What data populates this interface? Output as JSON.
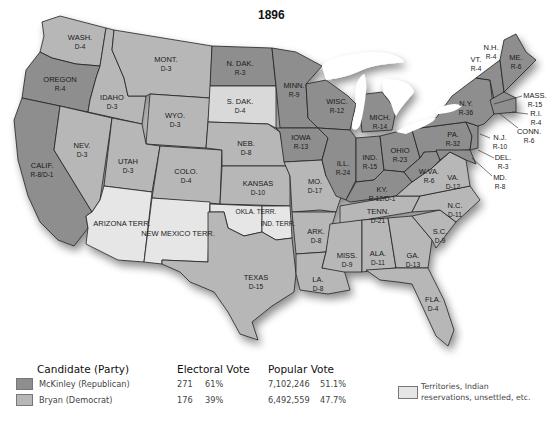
{
  "map": {
    "title": "1896",
    "colors": {
      "republican": "#8e8e8e",
      "democrat": "#b7b7b7",
      "territory": "#e6e6e6",
      "water": "#ffffff",
      "border": "#222222"
    },
    "states": [
      {
        "name": "WASH.",
        "result": "D-4",
        "party": "democrat"
      },
      {
        "name": "OREGON",
        "result": "R-4",
        "party": "republican"
      },
      {
        "name": "CALIF.",
        "result": "R-8/D-1",
        "party": "split"
      },
      {
        "name": "IDAHO",
        "result": "D-3",
        "party": "democrat"
      },
      {
        "name": "NEV.",
        "result": "D-3",
        "party": "democrat"
      },
      {
        "name": "MONT.",
        "result": "D-3",
        "party": "democrat"
      },
      {
        "name": "WYO.",
        "result": "D-3",
        "party": "democrat"
      },
      {
        "name": "UTAH",
        "result": "D-3",
        "party": "democrat"
      },
      {
        "name": "COLO.",
        "result": "D-4",
        "party": "democrat"
      },
      {
        "name": "ARIZONA TERR.",
        "result": "",
        "party": "territory"
      },
      {
        "name": "NEW MEXICO TERR.",
        "result": "",
        "party": "territory"
      },
      {
        "name": "N. DAK.",
        "result": "R-3",
        "party": "republican"
      },
      {
        "name": "S. DAK.",
        "result": "D-4",
        "party": "democrat"
      },
      {
        "name": "NEB.",
        "result": "D-8",
        "party": "democrat"
      },
      {
        "name": "KANSAS",
        "result": "D-10",
        "party": "democrat"
      },
      {
        "name": "OKLA. TERR.",
        "result": "",
        "party": "territory"
      },
      {
        "name": "IND. TERR.",
        "result": "",
        "party": "territory"
      },
      {
        "name": "TEXAS",
        "result": "D-15",
        "party": "democrat"
      },
      {
        "name": "MINN.",
        "result": "R-9",
        "party": "republican"
      },
      {
        "name": "IOWA",
        "result": "R-13",
        "party": "republican"
      },
      {
        "name": "MO.",
        "result": "D-17",
        "party": "democrat"
      },
      {
        "name": "ARK.",
        "result": "D-8",
        "party": "democrat"
      },
      {
        "name": "LA.",
        "result": "D-8",
        "party": "democrat"
      },
      {
        "name": "WISC.",
        "result": "R-12",
        "party": "republican"
      },
      {
        "name": "ILL.",
        "result": "R-24",
        "party": "republican"
      },
      {
        "name": "MICH.",
        "result": "R-14",
        "party": "republican"
      },
      {
        "name": "IND.",
        "result": "R-15",
        "party": "republican"
      },
      {
        "name": "OHIO",
        "result": "R-23",
        "party": "republican"
      },
      {
        "name": "KY.",
        "result": "R-12/D-1",
        "party": "split"
      },
      {
        "name": "TENN.",
        "result": "D-21",
        "party": "democrat"
      },
      {
        "name": "MISS.",
        "result": "D-9",
        "party": "democrat"
      },
      {
        "name": "ALA.",
        "result": "D-11",
        "party": "democrat"
      },
      {
        "name": "GA.",
        "result": "D-13",
        "party": "democrat"
      },
      {
        "name": "FLA.",
        "result": "D-4",
        "party": "democrat"
      },
      {
        "name": "S.C.",
        "result": "D-9",
        "party": "democrat"
      },
      {
        "name": "N.C.",
        "result": "D-11",
        "party": "democrat"
      },
      {
        "name": "VA.",
        "result": "D-12",
        "party": "democrat"
      },
      {
        "name": "W.VA.",
        "result": "R-6",
        "party": "republican"
      },
      {
        "name": "PA.",
        "result": "R-32",
        "party": "republican"
      },
      {
        "name": "N.Y.",
        "result": "R-36",
        "party": "republican"
      },
      {
        "name": "VT.",
        "result": "R-4",
        "party": "republican"
      },
      {
        "name": "N.H.",
        "result": "R-4",
        "party": "republican"
      },
      {
        "name": "ME.",
        "result": "R-6",
        "party": "republican"
      },
      {
        "name": "MASS.",
        "result": "R-15",
        "party": "republican"
      },
      {
        "name": "R.I.",
        "result": "R-4",
        "party": "republican"
      },
      {
        "name": "CONN.",
        "result": "R-6",
        "party": "republican"
      },
      {
        "name": "N.J.",
        "result": "R-10",
        "party": "republican"
      },
      {
        "name": "DEL.",
        "result": "R-3",
        "party": "republican"
      },
      {
        "name": "MD.",
        "result": "R-8",
        "party": "republican"
      }
    ]
  },
  "legend": {
    "headers": {
      "candidate": "Candidate (Party)",
      "electoral": "Electoral Vote",
      "popular": "Popular Vote"
    },
    "rows": [
      {
        "candidate": "McKinley (Republican)",
        "electoral_votes": "271",
        "electoral_pct": "61%",
        "popular_votes": "7,102,246",
        "popular_pct": "51.1%",
        "color": "#8e8e8e"
      },
      {
        "candidate": "Bryan (Democrat)",
        "electoral_votes": "176",
        "electoral_pct": "39%",
        "popular_votes": "6,492,559",
        "popular_pct": "47.7%",
        "color": "#b7b7b7"
      }
    ],
    "territory_note": {
      "line1": "Territories, Indian",
      "line2": "reservations, unsettled, etc.",
      "color": "#e6e6e6"
    }
  }
}
